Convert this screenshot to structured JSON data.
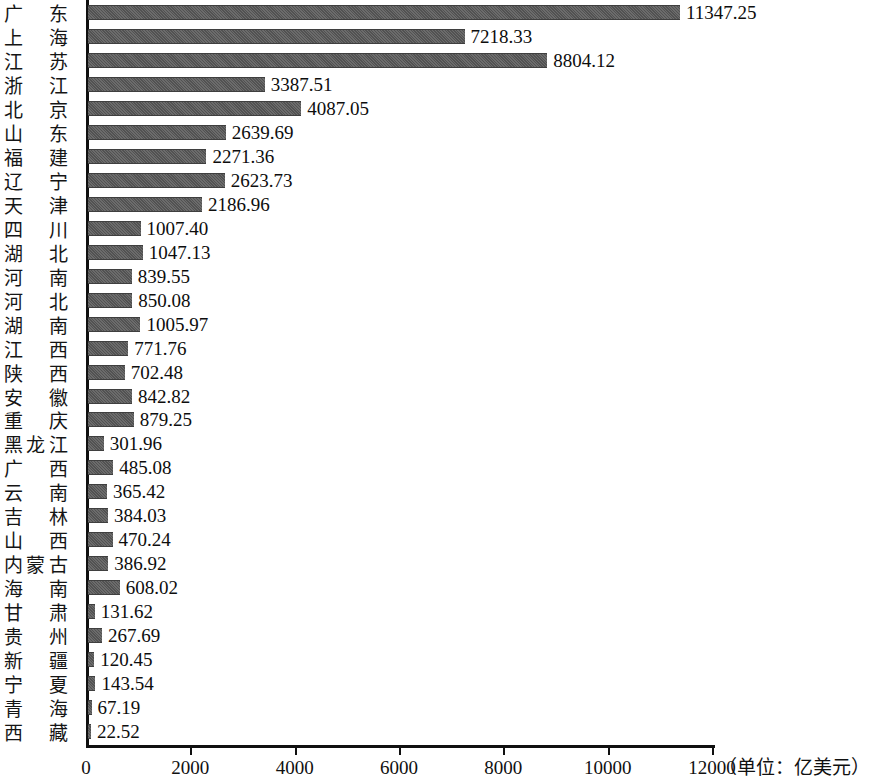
{
  "chart_data": {
    "type": "bar",
    "orientation": "horizontal",
    "title": "",
    "xlabel": "",
    "ylabel": "",
    "unit_note": "（单位：亿美元）",
    "xlim": [
      0,
      12000
    ],
    "grid": false,
    "legend": null,
    "axis_ticks": [
      "0",
      "2000",
      "4000",
      "6000",
      "8000",
      "10000",
      "12000"
    ],
    "axis_tick_values": [
      0,
      2000,
      4000,
      6000,
      8000,
      10000,
      12000
    ],
    "categories": [
      "广东",
      "上海",
      "江苏",
      "浙江",
      "北京",
      "山东",
      "福建",
      "辽宁",
      "天津",
      "四川",
      "湖北",
      "河南",
      "河北",
      "湖南",
      "江西",
      "陕西",
      "安徽",
      "重庆",
      "黑龙江",
      "广西",
      "云南",
      "吉林",
      "山西",
      "内蒙古",
      "海南",
      "甘肃",
      "贵州",
      "新疆",
      "宁夏",
      "青海",
      "西藏"
    ],
    "values": [
      11347.25,
      7218.33,
      8804.12,
      3387.51,
      4087.05,
      2639.69,
      2271.36,
      2623.73,
      2186.96,
      1007.4,
      1047.13,
      839.55,
      850.08,
      1005.97,
      771.76,
      702.48,
      842.82,
      879.25,
      301.96,
      485.08,
      365.42,
      384.03,
      470.24,
      386.92,
      608.02,
      131.62,
      267.69,
      120.45,
      143.54,
      67.19,
      22.52
    ],
    "value_labels": [
      "11347.25",
      "7218.33",
      "8804.12",
      "3387.51",
      "4087.05",
      "2639.69",
      "2271.36",
      "2623.73",
      "2186.96",
      "1007.40",
      "1047.13",
      "839.55",
      "850.08",
      "1005.97",
      "771.76",
      "702.48",
      "842.82",
      "879.25",
      "301.96",
      "485.08",
      "365.42",
      "384.03",
      "470.24",
      "386.92",
      "608.02",
      "131.62",
      "267.69",
      "120.45",
      "143.54",
      "67.19",
      "22.52"
    ],
    "bar_color": "#5b5b5b",
    "axis_color": "#101010"
  }
}
